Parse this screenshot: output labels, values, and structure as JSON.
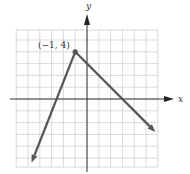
{
  "chart_data": {
    "type": "line",
    "title": "",
    "xlabel": "x",
    "ylabel": "y",
    "xlim": [
      -6,
      6
    ],
    "ylim": [
      -6,
      6
    ],
    "grid": true,
    "grid_step": 1,
    "series": [
      {
        "name": "graph",
        "points": [
          [
            -4.7,
            -5.4
          ],
          [
            -1,
            4
          ],
          [
            5.8,
            -2.8
          ]
        ],
        "segments": [
          {
            "from": [
              -1,
              4
            ],
            "to": [
              -4.7,
              -5.4
            ],
            "equation": "y = (8/3)(x + 1) + 4",
            "x_intercept": -2.5,
            "arrow_end": true
          },
          {
            "from": [
              -1,
              4
            ],
            "to": [
              5.8,
              -2.8
            ],
            "equation": "y = -x + 3",
            "x_intercept": 3,
            "arrow_end": true
          }
        ],
        "color": "#555555"
      }
    ],
    "annotations": [
      {
        "text": "(−1, 4)",
        "point": [
          -1,
          4
        ],
        "marker": "dot"
      }
    ]
  },
  "labels": {
    "x_axis": "x",
    "y_axis": "y",
    "vertex": "(−1, 4)"
  }
}
